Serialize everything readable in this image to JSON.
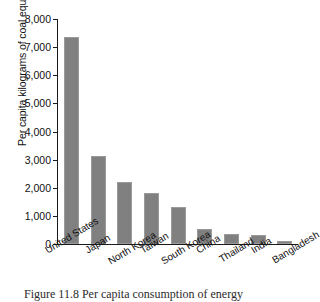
{
  "chart_data": {
    "type": "bar",
    "title": "",
    "xlabel": "",
    "ylabel": "Per capita kilograms of coal equivalent",
    "ylim": [
      0,
      8000
    ],
    "ytick_labels": [
      "8,000",
      "7,000",
      "6,000",
      "5,000",
      "4,000",
      "3,000",
      "2,000",
      "1,000",
      "0"
    ],
    "ytick_values": [
      8000,
      7000,
      6000,
      5000,
      4000,
      3000,
      2000,
      1000,
      0
    ],
    "grid": false,
    "legend": "none",
    "bar_color": "#808080",
    "categories": [
      "United States",
      "Japan",
      "North Korea",
      "Taiwan",
      "South Korea",
      "China",
      "Thailand",
      "India",
      "Bangladesh"
    ],
    "values": [
      7350,
      3130,
      2200,
      1800,
      1310,
      550,
      360,
      310,
      110
    ]
  },
  "caption": {
    "text": "Figure 11.8  Per capita consumption of energy"
  }
}
